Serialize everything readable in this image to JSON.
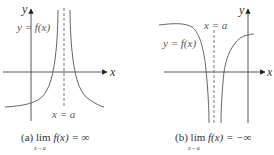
{
  "panels": [
    {
      "id": "a",
      "y_axis_label": "y",
      "x_axis_label": "x",
      "curve_label": "y = f(x)",
      "asymptote_label": "x = a",
      "caption": {
        "prefix": "(a)",
        "lim": "lim",
        "subscript": "x→a",
        "expr": "f(x) = ∞"
      }
    },
    {
      "id": "b",
      "y_axis_label": "y",
      "x_axis_label": "x",
      "curve_label": "y = f(x)",
      "asymptote_label": "x = a",
      "caption": {
        "prefix": "(b)",
        "lim": "lim",
        "subscript": "x→a",
        "expr": "f(x) = −∞"
      }
    }
  ],
  "colors": {
    "curve": "#555555",
    "axis": "#444444",
    "asymptote": "#666666",
    "text": "#333333"
  }
}
